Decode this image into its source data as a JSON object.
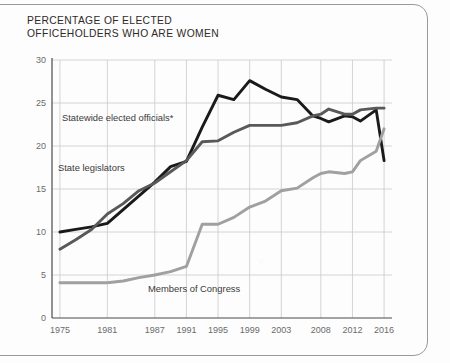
{
  "title": "PERCENTAGE OF ELECTED\nOFFICEHOLDERS WHO ARE WOMEN",
  "colors": {
    "statewide": "#1a1a1a",
    "legislators": "#595959",
    "congress": "#a0a0a0",
    "grid": "#c9c9c9",
    "axis": "#4a4a4a",
    "text": "#2d2a28",
    "paper": "#fdfdfd"
  },
  "labels": {
    "statewide": "Statewide elected officials*",
    "legislators": "State legislators",
    "congress": "Members of Congress"
  },
  "chart_data": {
    "type": "line",
    "title": "PERCENTAGE OF ELECTED OFFICEHOLDERS WHO ARE WOMEN",
    "xlabel": "",
    "ylabel": "",
    "xlim": [
      1974,
      2017
    ],
    "ylim": [
      0,
      30
    ],
    "yticks": [
      0,
      5,
      10,
      15,
      20,
      25,
      30
    ],
    "xticks": [
      1975,
      1981,
      1987,
      1991,
      1995,
      1999,
      2003,
      2008,
      2012,
      2016
    ],
    "xtick_labels": [
      "1975",
      "1981",
      "1987",
      "1991",
      "1995",
      "1999",
      "2003",
      "2008",
      "2012",
      "2016"
    ],
    "ytick_labels": [
      "0",
      "5",
      "10",
      "15",
      "20",
      "25",
      "30"
    ],
    "grid": true,
    "legend": "inline-annotations",
    "annotation": "*",
    "series": [
      {
        "name": "Statewide elected officials*",
        "color": "#1a1a1a",
        "x": [
          1975,
          1977,
          1979,
          1981,
          1983,
          1985,
          1987,
          1989,
          1991,
          1993,
          1995,
          1997,
          1999,
          2001,
          2003,
          2005,
          2007,
          2008,
          2009,
          2011,
          2012,
          2013,
          2015,
          2016
        ],
        "values": [
          10.0,
          10.3,
          10.6,
          11.0,
          12.6,
          14.2,
          15.8,
          17.6,
          18.2,
          22.2,
          25.9,
          25.4,
          27.6,
          26.6,
          25.7,
          25.4,
          23.5,
          23.2,
          22.8,
          23.5,
          23.4,
          22.9,
          24.2,
          18.3
        ],
        "start_value": 10.0,
        "peak_value": 27.6,
        "peak_year": 1999,
        "end_value": 18.3
      },
      {
        "name": "State legislators",
        "color": "#595959",
        "x": [
          1975,
          1977,
          1979,
          1981,
          1983,
          1985,
          1987,
          1989,
          1991,
          1993,
          1995,
          1997,
          1999,
          2001,
          2003,
          2005,
          2007,
          2008,
          2009,
          2011,
          2012,
          2013,
          2015,
          2016
        ],
        "values": [
          8.0,
          9.1,
          10.3,
          12.1,
          13.3,
          14.8,
          15.7,
          17.0,
          18.3,
          20.5,
          20.6,
          21.6,
          22.4,
          22.4,
          22.4,
          22.7,
          23.5,
          23.7,
          24.3,
          23.7,
          23.7,
          24.2,
          24.4,
          24.4
        ],
        "start_value": 8.0,
        "end_value": 24.4
      },
      {
        "name": "Members of Congress",
        "color": "#a0a0a0",
        "x": [
          1975,
          1977,
          1979,
          1981,
          1983,
          1985,
          1987,
          1989,
          1991,
          1993,
          1995,
          1997,
          1999,
          2001,
          2003,
          2005,
          2007,
          2008,
          2009,
          2011,
          2012,
          2013,
          2015,
          2016
        ],
        "values": [
          4.1,
          4.1,
          4.1,
          4.1,
          4.3,
          4.7,
          5.0,
          5.4,
          6.0,
          10.9,
          10.9,
          11.7,
          12.9,
          13.6,
          14.8,
          15.1,
          16.3,
          16.8,
          17.0,
          16.8,
          17.0,
          18.3,
          19.4,
          22.0
        ],
        "start_value": 4.1,
        "end_value": 22.0
      }
    ]
  }
}
